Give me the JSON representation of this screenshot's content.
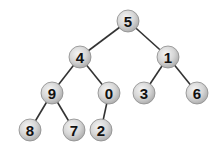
{
  "tree": {
    "type": "binary-tree",
    "nodes": [
      {
        "id": "n5",
        "value": "5",
        "x": 128,
        "y": 21
      },
      {
        "id": "n4",
        "value": "4",
        "x": 80,
        "y": 57
      },
      {
        "id": "n1",
        "value": "1",
        "x": 168,
        "y": 57
      },
      {
        "id": "n9",
        "value": "9",
        "x": 52,
        "y": 93
      },
      {
        "id": "n0",
        "value": "0",
        "x": 109,
        "y": 93
      },
      {
        "id": "n3",
        "value": "3",
        "x": 144,
        "y": 93
      },
      {
        "id": "n6",
        "value": "6",
        "x": 197,
        "y": 93
      },
      {
        "id": "n8",
        "value": "8",
        "x": 30,
        "y": 130
      },
      {
        "id": "n7",
        "value": "7",
        "x": 74,
        "y": 130
      },
      {
        "id": "n2",
        "value": "2",
        "x": 101,
        "y": 130
      }
    ],
    "edges": [
      [
        "n5",
        "n4"
      ],
      [
        "n5",
        "n1"
      ],
      [
        "n4",
        "n9"
      ],
      [
        "n4",
        "n0"
      ],
      [
        "n1",
        "n3"
      ],
      [
        "n1",
        "n6"
      ],
      [
        "n9",
        "n8"
      ],
      [
        "n9",
        "n7"
      ],
      [
        "n0",
        "n2"
      ]
    ],
    "style": {
      "node_radius": 11,
      "edge_color": "#333333",
      "node_fill_light": "#f4f4f4",
      "node_fill_dark": "#a8a8a8",
      "node_stroke": "#8a8a8a"
    }
  }
}
